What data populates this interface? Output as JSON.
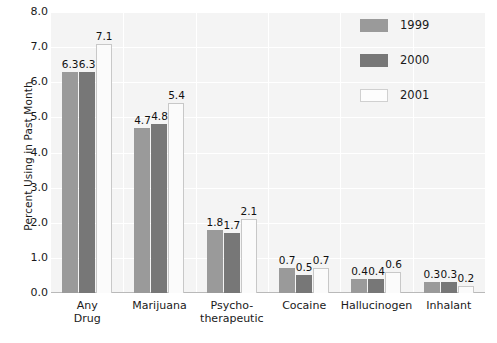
{
  "chart_data": {
    "type": "bar",
    "title": "",
    "subtitle": "",
    "xlabel": "",
    "ylabel": "Percent Using in Past Month",
    "ylim": [
      0.0,
      8.0
    ],
    "ytick_step": 1.0,
    "ytick_labels": [
      "8.0",
      "7.0",
      "6.0",
      "5.0",
      "4.0",
      "3.0",
      "2.0",
      "1.0",
      "0.0"
    ],
    "ytick_values": [
      8.0,
      7.0,
      6.0,
      5.0,
      4.0,
      3.0,
      2.0,
      1.0,
      0.0
    ],
    "grid": true,
    "grid_axis": "y",
    "legend_position": "top-right",
    "categories": [
      "Any Drug",
      "Marijuana",
      "Psycho-therapeutic",
      "Cocaine",
      "Hallucinogen",
      "Inhalant"
    ],
    "category_lines": [
      [
        "Any",
        "Drug"
      ],
      [
        "Marijuana"
      ],
      [
        "Psycho-",
        "therapeutic"
      ],
      [
        "Cocaine"
      ],
      [
        "Hallucinogen"
      ],
      [
        "Inhalant"
      ]
    ],
    "series": [
      {
        "name": "1999",
        "color": "#9a9a9a",
        "values": [
          6.3,
          4.7,
          1.8,
          0.7,
          0.4,
          0.3
        ],
        "labels": [
          "6.3",
          "4.7",
          "1.8",
          "0.7",
          "0.4",
          "0.3"
        ]
      },
      {
        "name": "2000",
        "color": "#777777",
        "values": [
          6.3,
          4.8,
          1.7,
          0.5,
          0.4,
          0.3
        ],
        "labels": [
          "6.3",
          "4.8",
          "1.7",
          "0.5",
          "0.4",
          "0.3"
        ]
      },
      {
        "name": "2001",
        "color": "#fbfbfb",
        "values": [
          7.1,
          5.4,
          2.1,
          0.7,
          0.6,
          0.2
        ],
        "labels": [
          "7.1",
          "5.4",
          "2.1",
          "0.7",
          "0.6",
          "0.2"
        ]
      }
    ]
  },
  "legend": {
    "items": [
      {
        "label": "1999",
        "swatch": "series-1999-swatch"
      },
      {
        "label": "2000",
        "swatch": "series-2000-swatch"
      },
      {
        "label": "2001",
        "swatch": "series-2001-swatch"
      }
    ]
  },
  "colors": {
    "plot_background": "#f4f4f4",
    "page_background": "#ffffff",
    "gridline": "#ffffff",
    "axis": "#b9b9b9",
    "text": "#1a1a1a"
  }
}
